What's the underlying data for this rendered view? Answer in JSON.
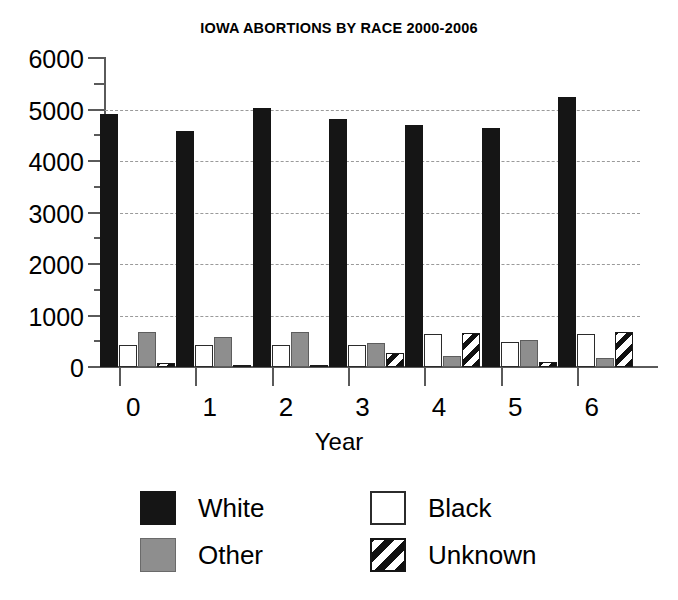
{
  "chart_data": {
    "type": "bar",
    "title": "IOWA ABORTIONS BY RACE 2000-2006",
    "xlabel": "Year",
    "ylabel": "",
    "categories": [
      "0",
      "1",
      "2",
      "3",
      "4",
      "5",
      "6"
    ],
    "ylim": [
      0,
      6000
    ],
    "ytick_labels": [
      "0",
      "1000",
      "2000",
      "3000",
      "4000",
      "5000",
      "6000"
    ],
    "ytick_values": [
      0,
      1000,
      2000,
      3000,
      4000,
      5000,
      6000
    ],
    "yminor_step": 500,
    "grid": "horizontal-dotted",
    "legend_position": "bottom",
    "series": [
      {
        "name": "White",
        "fill": "solid-black",
        "color": "#151515",
        "values": [
          4920,
          4590,
          5030,
          4810,
          4690,
          4650,
          5250
        ]
      },
      {
        "name": "Black",
        "fill": "open-white",
        "color": "#ffffff",
        "values": [
          420,
          430,
          420,
          420,
          640,
          490,
          640
        ]
      },
      {
        "name": "Other",
        "fill": "solid-gray",
        "color": "#8e8e8e",
        "values": [
          680,
          590,
          680,
          470,
          220,
          520,
          180
        ]
      },
      {
        "name": "Unknown",
        "fill": "diagonal-hatch",
        "color": "#101010",
        "values": [
          80,
          40,
          20,
          280,
          660,
          100,
          680
        ]
      }
    ]
  },
  "legend": {
    "items": [
      {
        "label": "White",
        "swatch": "solid-black"
      },
      {
        "label": "Black",
        "swatch": "open-white"
      },
      {
        "label": "Other",
        "swatch": "solid-gray"
      },
      {
        "label": "Unknown",
        "swatch": "diagonal-hatch"
      }
    ]
  }
}
